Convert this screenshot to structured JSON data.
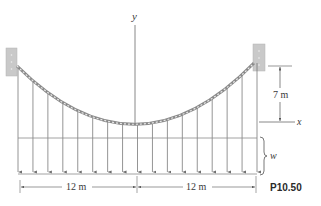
{
  "figure": {
    "id_label": "P10.50"
  },
  "axes": {
    "y_label": "y",
    "x_label": "x"
  },
  "dimensions": {
    "sag": "7 m",
    "left_span": "12 m",
    "right_span": "12 m"
  },
  "load": {
    "label": "w",
    "hanger_count": 17
  },
  "colors": {
    "line": "#7a7a7a",
    "support": "#c9c9c9",
    "cable": "#8a8a8a",
    "text": "#3a3a3a"
  }
}
